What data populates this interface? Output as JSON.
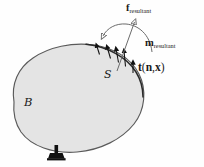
{
  "figure": {
    "background_color": "#fefefe"
  },
  "body": {
    "name": "continuum-body",
    "label_symbol": "B",
    "fill_color": "#e4e4e4",
    "stroke_color": "#5a5a5a",
    "stroke_width": 1.1
  },
  "surface": {
    "name": "surface-patch",
    "label_symbol": "S",
    "stroke_color": "#2a2a2a"
  },
  "traction": {
    "label_prefix": "t",
    "label_args_open": "(",
    "label_arg_n": "n",
    "label_comma": ",",
    "label_arg_x": "x",
    "label_args_close": ")",
    "arrow_color": "#111111",
    "arrow_count": 5
  },
  "resultant_force": {
    "label_symbol": "f",
    "label_subscript": "resultant",
    "arrow_color": "#6b6b6b"
  },
  "resultant_moment": {
    "label_symbol": "m",
    "label_subscript": "resultant",
    "arc_color": "#6b6b6b"
  },
  "support": {
    "name": "pin-support",
    "color": "#111111"
  }
}
